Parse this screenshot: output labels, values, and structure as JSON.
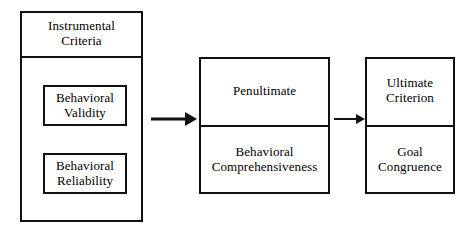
{
  "diagram": {
    "background_color": "#ffffff",
    "line_color": "#111111",
    "text_color": "#000000"
  },
  "left_group": {
    "header": "Instrumental\nCriteria",
    "header_line1": "Instrumental",
    "header_line2": "Criteria",
    "items": [
      {
        "line1": "Behavioral",
        "line2": "Validity"
      },
      {
        "line1": "Behavioral",
        "line2": "Reliability"
      }
    ]
  },
  "middle_group": {
    "top": {
      "line1": "Penultimate",
      "line2": ""
    },
    "bottom": {
      "line1": "Behavioral",
      "line2": "Comprehensiveness"
    }
  },
  "right_group": {
    "top": {
      "line1": "Ultimate",
      "line2": "Criterion"
    },
    "bottom": {
      "line1": "Goal",
      "line2": "Congruence"
    }
  },
  "arrows": [
    {
      "name": "arrow-left-to-middle",
      "direction": "right"
    },
    {
      "name": "arrow-middle-to-right",
      "direction": "right"
    }
  ]
}
